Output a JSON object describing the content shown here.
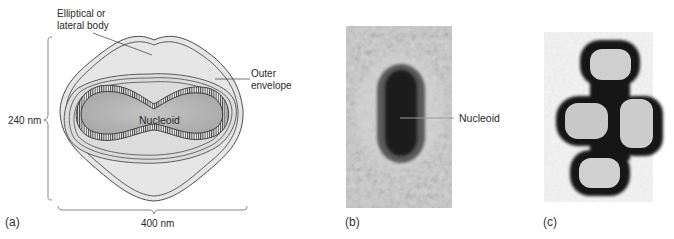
{
  "figure": {
    "panels": [
      {
        "id": "a",
        "label": "(a)",
        "type": "schematic diagram",
        "annotations": {
          "lateral_body": "Elliptical or\nlateral body",
          "lateral_body_line1": "Elliptical or",
          "lateral_body_line2": "lateral body",
          "outer_envelope_line1": "Outer",
          "outer_envelope_line2": "envelope",
          "nucleoid": "Nucleoid",
          "height_dim": "240 nm",
          "width_dim": "400 nm"
        }
      },
      {
        "id": "b",
        "label": "(b)",
        "type": "electron micrograph",
        "annotations": {
          "nucleoid": "Nucleoid"
        }
      },
      {
        "id": "c",
        "label": "(c)",
        "type": "electron micrograph",
        "annotations": {}
      }
    ],
    "colors": {
      "envelope_fill": "#e6e6e6",
      "nucleoid_fill": "#b9b9b9",
      "line": "#3a3a3a",
      "micrograph_bg": "#c8c8c8",
      "micrograph_dark": "#1a1a1a"
    }
  }
}
